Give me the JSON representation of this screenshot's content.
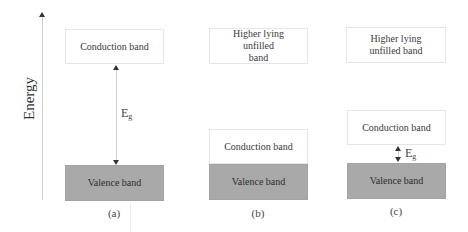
{
  "axis": {
    "label": "Energy"
  },
  "panels": [
    {
      "caption": "(a)",
      "bands": {
        "upper": "Conduction band",
        "lower": "Valence band"
      },
      "gap": {
        "label_main": "E",
        "label_sub": "g"
      }
    },
    {
      "caption": "(b)",
      "bands": {
        "top": "Higher lying unfilled band",
        "upper": "Conduction band",
        "lower": "Valence band"
      }
    },
    {
      "caption": "(c)",
      "bands": {
        "top": "Higher lying unfilled band",
        "upper": "Conduction band",
        "lower": "Valence band"
      },
      "gap": {
        "label_main": "E",
        "label_sub": "g"
      }
    }
  ],
  "colors": {
    "valence_fill": "#a9a9a9",
    "conduction_fill": "#ffffff",
    "box_border": "#e6e6e6"
  }
}
